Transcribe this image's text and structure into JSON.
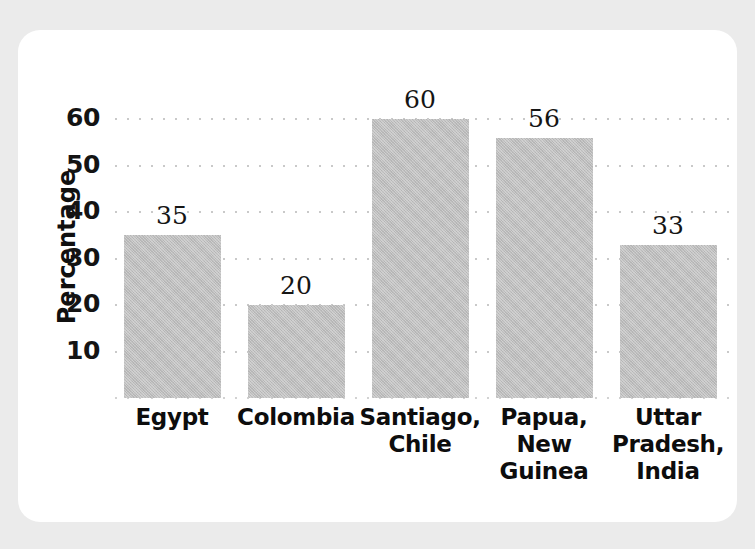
{
  "chart_data": {
    "type": "bar",
    "title": "",
    "subtitle": "",
    "xlabel": "",
    "ylabel": "Percentage",
    "categories": [
      "Egypt",
      "Colombia",
      "Santiago, Chile",
      "Papua, New Guinea",
      "Uttar Pradesh, India"
    ],
    "category_lines": [
      [
        "Egypt"
      ],
      [
        "Colombia"
      ],
      [
        "Santiago,",
        "Chile"
      ],
      [
        "Papua,",
        "New",
        "Guinea"
      ],
      [
        "Uttar",
        "Pradesh,",
        "India"
      ]
    ],
    "values": [
      35,
      20,
      60,
      56,
      33
    ],
    "value_labels": [
      "35",
      "20",
      "60",
      "56",
      "33"
    ],
    "ylim": [
      0,
      65
    ],
    "yticks": [
      10,
      20,
      30,
      40,
      50,
      60
    ],
    "ytick_labels": [
      "10",
      "20",
      "30",
      "40",
      "50",
      "60"
    ],
    "grid": true,
    "grid_style": "dotted",
    "legend": "none",
    "series": [
      {
        "name": "Percentage",
        "values": [
          35,
          20,
          60,
          56,
          33
        ]
      }
    ]
  },
  "style": {
    "bar_color": "#bdbdbd",
    "grid_color": "#c9c9c9",
    "text_color": "#111111",
    "panel_color": "#ffffff",
    "page_color": "#ebebeb"
  }
}
